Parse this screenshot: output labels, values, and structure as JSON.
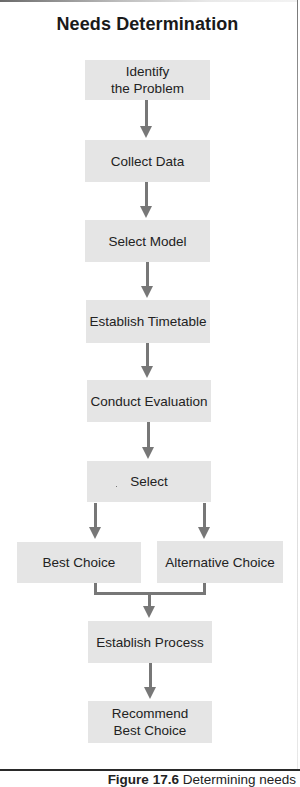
{
  "diagram": {
    "title": "Needs Determination",
    "nodes": {
      "identify_problem": {
        "line1": "Identify",
        "line2": "the Problem"
      },
      "collect_data": "Collect Data",
      "select_model": "Select Model",
      "establish_timetable": "Establish Timetable",
      "conduct_evaluation": "Conduct Evaluation",
      "select": "Select",
      "best_choice": "Best Choice",
      "alternative_choice": "Alternative Choice",
      "establish_process": "Establish Process",
      "recommend_best_choice": {
        "line1": "Recommend",
        "line2": "Best Choice"
      }
    },
    "edges": [
      [
        "identify_problem",
        "collect_data"
      ],
      [
        "collect_data",
        "select_model"
      ],
      [
        "select_model",
        "establish_timetable"
      ],
      [
        "establish_timetable",
        "conduct_evaluation"
      ],
      [
        "conduct_evaluation",
        "select"
      ],
      [
        "select",
        "best_choice"
      ],
      [
        "select",
        "alternative_choice"
      ],
      [
        "best_choice",
        "establish_process"
      ],
      [
        "alternative_choice",
        "establish_process"
      ],
      [
        "establish_process",
        "recommend_best_choice"
      ]
    ],
    "colors": {
      "box_fill": "#e5e5e5",
      "arrow": "#777777",
      "text": "#222222"
    }
  },
  "caption": {
    "label": "Figure 17.6",
    "text": "Determining needs"
  }
}
